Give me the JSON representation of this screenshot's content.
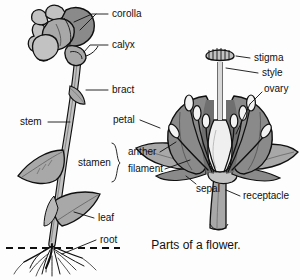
{
  "figure": {
    "caption": "Parts of a flower.",
    "caption_pos": {
      "x": 196,
      "y": 246
    }
  },
  "palette": {
    "background": "#fdfdfd",
    "ink": "#101010",
    "gray_light": "#c2c2c2",
    "gray_mid": "#a8a8a8",
    "gray_dark": "#8a8a8a",
    "gray_darker": "#6f6f6f",
    "highlight": "#efefef"
  },
  "labels": {
    "whole_plant": [
      {
        "id": "corolla",
        "text": "corolla",
        "x": 112,
        "y": 14
      },
      {
        "id": "calyx",
        "text": "calyx",
        "x": 112,
        "y": 45
      },
      {
        "id": "bract",
        "text": "bract",
        "x": 112,
        "y": 90
      },
      {
        "id": "stem",
        "text": "stem",
        "x": 20,
        "y": 122
      },
      {
        "id": "leaf",
        "text": "leaf",
        "x": 98,
        "y": 218
      },
      {
        "id": "root",
        "text": "root",
        "x": 100,
        "y": 240
      }
    ],
    "dissected_flower": [
      {
        "id": "petal",
        "text": "petal",
        "x": 113,
        "y": 120
      },
      {
        "id": "stamen",
        "text": "stamen",
        "x": 78,
        "y": 163
      },
      {
        "id": "anther",
        "text": "anther",
        "x": 128,
        "y": 152
      },
      {
        "id": "filament",
        "text": "filament",
        "x": 128,
        "y": 169
      },
      {
        "id": "sepal",
        "text": "sepal",
        "x": 196,
        "y": 189
      },
      {
        "id": "stigma",
        "text": "stigma",
        "x": 254,
        "y": 58
      },
      {
        "id": "style",
        "text": "style",
        "x": 262,
        "y": 73
      },
      {
        "id": "ovary",
        "text": "ovary",
        "x": 264,
        "y": 89
      },
      {
        "id": "receptacle",
        "text": "receptacle",
        "x": 243,
        "y": 196
      }
    ]
  }
}
